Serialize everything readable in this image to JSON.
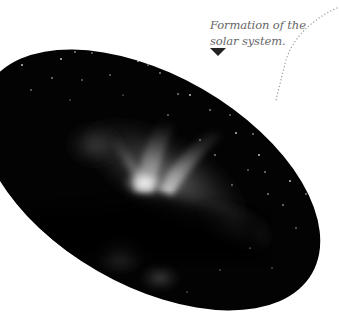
{
  "caption": {
    "line1": "Formation of the",
    "line2": "solar system."
  },
  "image": {
    "subject": "nebula-star-field",
    "shape": "rotated-ellipse",
    "background_color": "#000000",
    "page_background": "#ffffff"
  },
  "annotation": {
    "pointer": "down-triangle",
    "connector": "dotted-curve",
    "connector_color": "#999999",
    "pointer_color": "#222222"
  }
}
